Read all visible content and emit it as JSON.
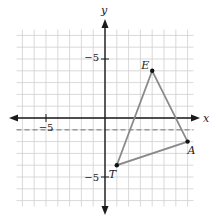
{
  "figure": {
    "type": "coordinate-plane",
    "x_axis_label": "x",
    "y_axis_label": "y",
    "tick_labels": {
      "x_negative": "−5",
      "y_positive": "−5",
      "y_negative": "−5"
    },
    "grid": {
      "min": -7.5,
      "max": 7.5,
      "step": 1,
      "color": "#cfcfcf"
    },
    "axis_color": "#1a1a1a",
    "triangle": {
      "color": "#8a8a8a",
      "vertices": [
        {
          "name": "E",
          "x": 4,
          "y": 4
        },
        {
          "name": "A",
          "x": 7,
          "y": -2
        },
        {
          "name": "T",
          "x": 1,
          "y": -4
        }
      ]
    },
    "dashed_line": {
      "y": -1,
      "color": "#9a9a9a",
      "label": "y = -1"
    }
  }
}
